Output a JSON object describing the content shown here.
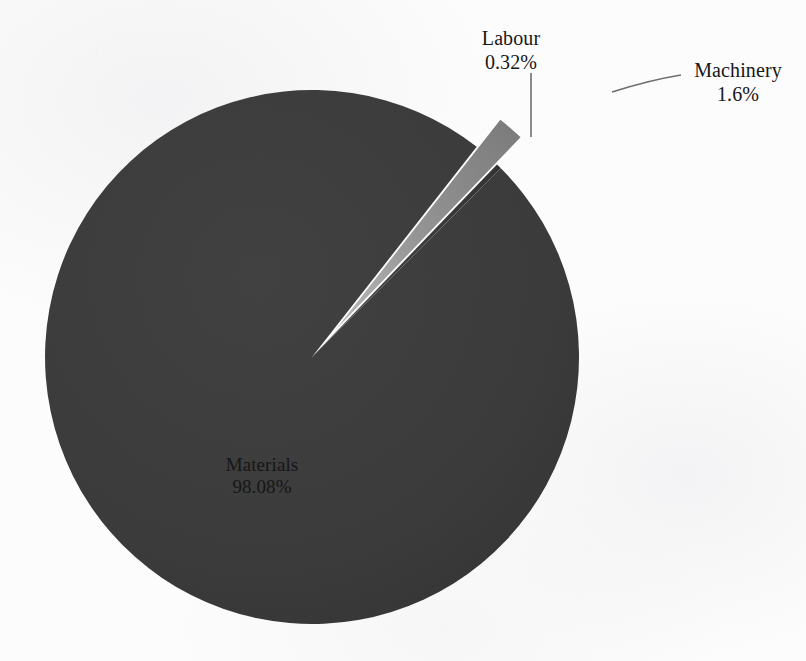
{
  "chart_data": {
    "type": "pie",
    "title": "",
    "subtitle": "",
    "xlabel": "",
    "ylabel": "",
    "legend_position": "none",
    "grid": false,
    "labels_show_name_and_percent": true,
    "categories": [
      "Materials",
      "Machinery",
      "Labour"
    ],
    "values": [
      98.08,
      1.6,
      0.32
    ],
    "units": "percent",
    "total": 100,
    "slices": [
      {
        "name": "Materials",
        "percent_label": "98.08%",
        "value": 98.08,
        "color": "#3b3b3b",
        "exploded": false,
        "label_position": "inside",
        "label_x": 262,
        "label_y": 466
      },
      {
        "name": "Machinery",
        "percent_label": "1.6%",
        "value": 1.6,
        "color": "#8a8a8a",
        "exploded": true,
        "label_position": "outside",
        "label_x": 738,
        "label_y": 72,
        "leader_line": true
      },
      {
        "name": "Labour",
        "percent_label": "0.32%",
        "value": 0.32,
        "color": "#3b3b3b",
        "exploded": false,
        "label_position": "outside",
        "label_x": 511,
        "label_y": 38,
        "leader_line": true
      }
    ],
    "geometry": {
      "center_x": 312,
      "center_y": 357,
      "radius": 267,
      "start_angle_deg": -45
    }
  },
  "labels": {
    "labour": {
      "name": "Labour",
      "percent": "0.32%"
    },
    "machinery": {
      "name": "Machinery",
      "percent": "1.6%"
    },
    "materials": {
      "name": "Materials",
      "percent": "98.08%"
    }
  },
  "colors": {
    "materials_fill": "#3b3b3b",
    "machinery_fill": "#8a8a8a",
    "labour_fill": "#3d3d3d",
    "background": "#fcfcfc",
    "leader_line": "#6e6e6e",
    "label_text_dark": "#171717",
    "label_text_on_pie": "#141414"
  }
}
